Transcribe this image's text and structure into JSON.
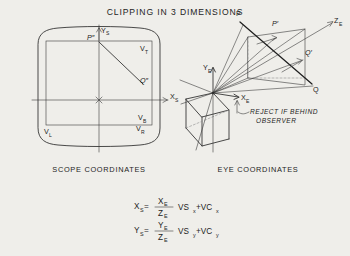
{
  "figure": {
    "title": "CLIPPING IN 3 DIMENSIONS",
    "background_color": "#efeeea",
    "ink_color": "#2b2b2b"
  },
  "panels": [
    {
      "id": "scope",
      "caption": "SCOPE COORDINATES",
      "axis_labels": {
        "x": "X",
        "x_sub": "S",
        "y": "Y",
        "y_sub": "S"
      },
      "points": [
        {
          "name": "P-double-prime",
          "label": "P″"
        },
        {
          "name": "Q-double-prime",
          "label": "Q″"
        }
      ],
      "viewport_labels": [
        {
          "name": "viewport-top",
          "label": "V",
          "sub": "T"
        },
        {
          "name": "viewport-bottom",
          "label": "V",
          "sub": "B"
        },
        {
          "name": "viewport-left",
          "label": "V",
          "sub": "L"
        },
        {
          "name": "viewport-right",
          "label": "V",
          "sub": "R"
        }
      ]
    },
    {
      "id": "eye",
      "caption": "EYE COORDINATES",
      "axis_labels": {
        "x": "X",
        "x_sub": "E",
        "y": "Y",
        "y_sub": "E",
        "z": "Z",
        "z_sub": "E"
      },
      "points": [
        {
          "name": "point-P",
          "label": "P"
        },
        {
          "name": "point-P-prime",
          "label": "P′"
        },
        {
          "name": "point-Q",
          "label": "Q"
        },
        {
          "name": "point-Q-prime",
          "label": "Q′"
        }
      ],
      "annotation": {
        "name": "reject-behind-observer",
        "line1": "REJECT IF BEHIND",
        "line2": "OBSERVER"
      }
    }
  ],
  "equations": [
    {
      "name": "equation-xs",
      "lhs": "X",
      "lhs_sub": "S",
      "eq": "=",
      "num": "X",
      "num_sub": "E",
      "den": "Z",
      "den_sub": "E",
      "tail": "VS",
      "tail_sub": "x",
      "plus": "+VC",
      "plus_sub": "x"
    },
    {
      "name": "equation-ys",
      "lhs": "Y",
      "lhs_sub": "S",
      "eq": "=",
      "num": "Y",
      "num_sub": "E",
      "den": "Z",
      "den_sub": "E",
      "tail": "VS",
      "tail_sub": "y",
      "plus": "+VC",
      "plus_sub": "y"
    }
  ]
}
